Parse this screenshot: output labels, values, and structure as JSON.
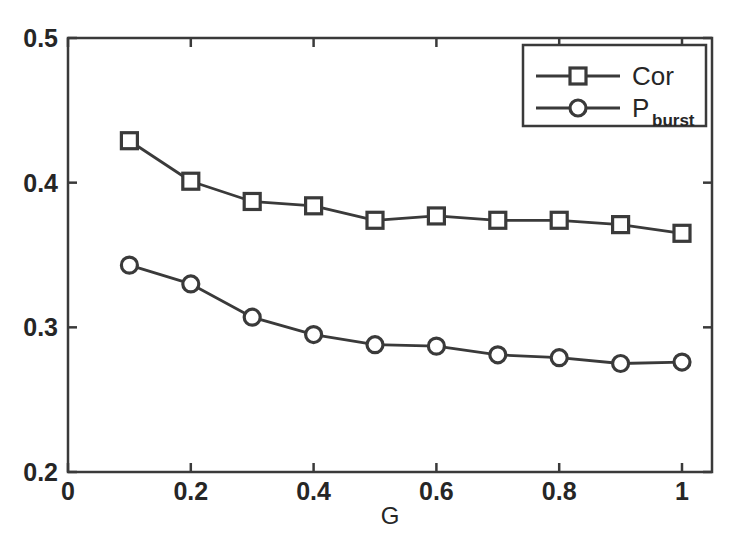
{
  "chart_data": {
    "type": "line",
    "title": "",
    "xlabel": "G",
    "ylabel": "",
    "x": [
      0.1,
      0.2,
      0.3,
      0.4,
      0.5,
      0.6,
      0.7,
      0.8,
      0.9,
      1.0
    ],
    "xlim": [
      0,
      1
    ],
    "ylim": [
      0.2,
      0.5
    ],
    "xticks": [
      0,
      0.2,
      0.4,
      0.6,
      0.8,
      1
    ],
    "xtick_labels": [
      "0",
      "0.2",
      "0.4",
      "0.6",
      "0.8",
      "1"
    ],
    "yticks": [
      0.2,
      0.3,
      0.4,
      0.5
    ],
    "ytick_labels": [
      "0.2",
      "0.3",
      "0.4",
      "0.5"
    ],
    "grid": false,
    "legend_position": "top-right",
    "series": [
      {
        "name": "Cor",
        "label_main": "Cor",
        "label_sub": "",
        "marker": "square",
        "color": "#3a3a3a",
        "values": [
          0.429,
          0.401,
          0.387,
          0.384,
          0.374,
          0.377,
          0.374,
          0.374,
          0.371,
          0.365
        ]
      },
      {
        "name": "P_burst",
        "label_main": "P",
        "label_sub": "burst",
        "marker": "circle",
        "color": "#3a3a3a",
        "values": [
          0.343,
          0.33,
          0.307,
          0.295,
          0.288,
          0.287,
          0.281,
          0.279,
          0.275,
          0.276
        ]
      }
    ]
  },
  "axes": {
    "frame_color": "#3a3a3a",
    "background": "#ffffff"
  }
}
